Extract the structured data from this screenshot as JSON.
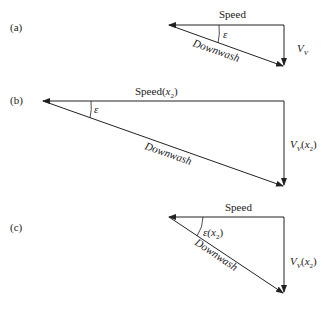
{
  "diagrams": [
    {
      "label": "(a)",
      "speed": "Speed",
      "angle": "ε",
      "downwash": "Downwash",
      "vertical": "V",
      "vertical_sub": "V",
      "vertical_suffix": ""
    },
    {
      "label": "(b)",
      "speed": "Speed(",
      "speed_var": "x",
      "speed_sub": "2",
      "speed_close": ")",
      "angle": "ε",
      "downwash": "Downwash",
      "vertical": "V",
      "vertical_sub": "V",
      "vertical_suffix_open": "(",
      "vertical_var": "x",
      "vertical_var_sub": "2",
      "vertical_suffix_close": ")"
    },
    {
      "label": "(c)",
      "speed": "Speed",
      "angle": "ε(",
      "angle_var": "x",
      "angle_sub": "2",
      "angle_close": ")",
      "downwash": "Downwash",
      "vertical": "V",
      "vertical_sub": "V",
      "vertical_suffix_open": "(",
      "vertical_var": "x",
      "vertical_var_sub": "2",
      "vertical_suffix_close": ")"
    }
  ],
  "colors": {
    "line": "#222222",
    "background": "#ffffff"
  }
}
